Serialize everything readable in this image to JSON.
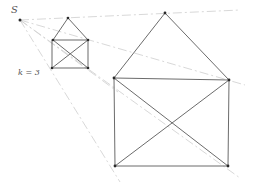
{
  "diagram": {
    "center_label": "S",
    "scale_label": "k = 3",
    "center": {
      "x": 20,
      "y": 20
    },
    "small_house": {
      "apex": {
        "x": 68,
        "y": 18
      },
      "top_left": {
        "x": 53,
        "y": 40
      },
      "top_right": {
        "x": 88,
        "y": 40
      },
      "bottom_left": {
        "x": 52,
        "y": 68
      },
      "bottom_right": {
        "x": 88,
        "y": 68
      }
    },
    "large_house": {
      "apex": {
        "x": 165,
        "y": 13
      },
      "top_left": {
        "x": 114,
        "y": 78
      },
      "top_right": {
        "x": 229,
        "y": 80
      },
      "bottom_left": {
        "x": 115,
        "y": 166
      },
      "bottom_right": {
        "x": 228,
        "y": 166
      }
    },
    "colors": {
      "edges": "#5a5a5a",
      "construction": "#d4d4d4",
      "vertices": "#2a2a2a"
    }
  }
}
